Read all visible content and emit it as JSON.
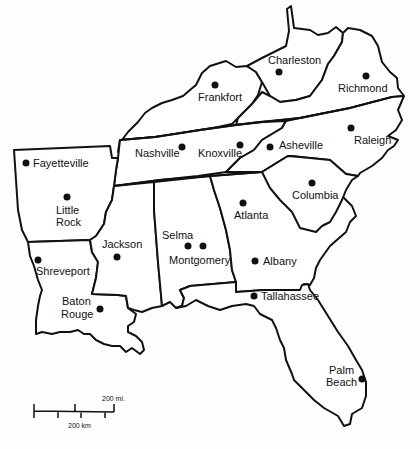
{
  "map": {
    "title": "Southeastern United States",
    "cities": [
      {
        "name": "Charleston",
        "label": "Charleston",
        "x": 279,
        "y": 72
      },
      {
        "name": "Frankfort",
        "label": "Frankfort",
        "x": 215,
        "y": 85
      },
      {
        "name": "Richmond",
        "label": "Richmond",
        "x": 366,
        "y": 76
      },
      {
        "name": "Nashville",
        "label": "Nashville",
        "x": 182,
        "y": 147
      },
      {
        "name": "Knoxville",
        "label": "Knoxville",
        "x": 240,
        "y": 145
      },
      {
        "name": "Asheville",
        "label": "Asheville",
        "x": 270,
        "y": 147
      },
      {
        "name": "Raleigh",
        "label": "Raleigh",
        "x": 351,
        "y": 128
      },
      {
        "name": "Fayetteville",
        "label": "Fayetteville",
        "x": 26,
        "y": 163
      },
      {
        "name": "Little Rock",
        "label_line1": "Little",
        "label_line2": "Rock",
        "x": 67,
        "y": 197
      },
      {
        "name": "Columbia",
        "label": "Columbia",
        "x": 312,
        "y": 183
      },
      {
        "name": "Atlanta",
        "label": "Atlanta",
        "x": 243,
        "y": 203
      },
      {
        "name": "Selma",
        "label": "Selma",
        "x": 188,
        "y": 246
      },
      {
        "name": "Montgomery",
        "label": "Montgomery",
        "x": 203,
        "y": 246
      },
      {
        "name": "Jackson",
        "label": "Jackson",
        "x": 117,
        "y": 257
      },
      {
        "name": "Shreveport",
        "label": "Shreveport",
        "x": 38,
        "y": 260
      },
      {
        "name": "Albany",
        "label": "Albany",
        "x": 255,
        "y": 261
      },
      {
        "name": "Baton Rouge",
        "label_line1": "Baton",
        "label_line2": "Rouge",
        "x": 100,
        "y": 309
      },
      {
        "name": "Tallahassee",
        "label": "Tallahassee",
        "x": 254,
        "y": 296
      },
      {
        "name": "Palm Beach",
        "label_line1": "Palm",
        "label_line2": "Beach",
        "x": 362,
        "y": 379
      }
    ]
  },
  "scale": {
    "miles_label": "200 mi.",
    "km_label": "200 km"
  }
}
